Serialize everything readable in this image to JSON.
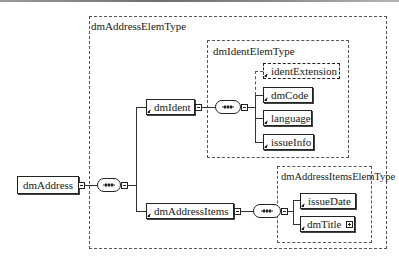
{
  "diagram": {
    "root": {
      "name": "dmAddress",
      "expander": "collapse"
    },
    "root_type": {
      "name": "dmAddressElemType",
      "compositor": "sequence",
      "children": [
        {
          "name": "dmIdent",
          "reference": true,
          "expander": "collapse",
          "type": {
            "name": "dmIdentElemType",
            "compositor": "sequence",
            "children": [
              {
                "name": "identExtension",
                "reference": true,
                "optional": true
              },
              {
                "name": "dmCode",
                "reference": true,
                "optional": false
              },
              {
                "name": "language",
                "reference": true,
                "optional": false
              },
              {
                "name": "issueInfo",
                "reference": true,
                "optional": false
              }
            ]
          }
        },
        {
          "name": "dmAddressItems",
          "reference": true,
          "expander": "collapse",
          "type": {
            "name": "dmAddressItemsElemType",
            "compositor": "sequence",
            "children": [
              {
                "name": "issueDate",
                "reference": true,
                "optional": false
              },
              {
                "name": "dmTitle",
                "reference": true,
                "optional": false,
                "expander": "expand"
              }
            ]
          }
        }
      ]
    }
  },
  "colors": {
    "line": "#222222",
    "dashed_border": "#555555",
    "background": "#ffffff"
  }
}
